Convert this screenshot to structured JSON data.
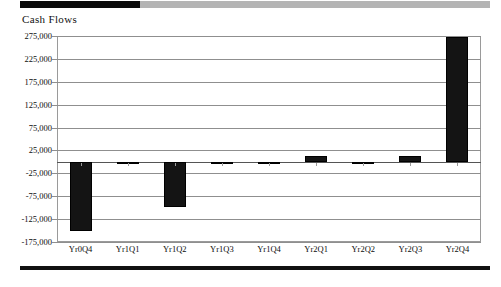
{
  "chart_title": "Cash Flows",
  "decorations": {
    "top_rule_black": "#0a0a0a",
    "top_rule_gray": "#b4b4b4",
    "bottom_rule": "#111111"
  },
  "chart_data": {
    "type": "bar",
    "title": "Cash Flows",
    "xlabel": "",
    "ylabel": "",
    "categories": [
      "Yr0Q4",
      "Yr1Q1",
      "Yr1Q2",
      "Yr1Q3",
      "Yr1Q4",
      "Yr2Q1",
      "Yr2Q2",
      "Yr2Q3",
      "Yr2Q4"
    ],
    "values": [
      -150000,
      0,
      -98000,
      0,
      0,
      13000,
      0,
      12000,
      272000
    ],
    "ylim": [
      -175000,
      275000
    ],
    "ytick_labels": [
      "275,000",
      "225,000",
      "175,000",
      "125,000",
      "75,000",
      "25,000",
      "-25,000",
      "-75,000",
      "-125,000",
      "-175,000"
    ],
    "ytick_values": [
      275000,
      225000,
      175000,
      125000,
      75000,
      25000,
      -25000,
      -75000,
      -125000,
      -175000
    ],
    "grid": true,
    "legend": false,
    "bar_color": "#141414",
    "zero_line": 0
  }
}
